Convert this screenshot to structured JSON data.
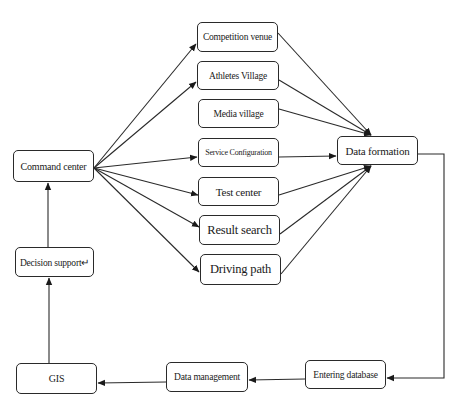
{
  "diagram": {
    "nodes": {
      "command_center": "Command center",
      "competition_venue": "Competition venue",
      "athletes_village": "Athletes Village",
      "media_village": "Media village",
      "service_configuration": "Service Configuration",
      "test_center": "Test center",
      "result_search": "Result search",
      "driving_path": "Driving path",
      "data_formation": "Data formation",
      "entering_database": "Entering database",
      "data_management": "Data management",
      "gis": "GIS",
      "decision_support": "Decision support↵"
    },
    "edges": [
      {
        "from": "command_center",
        "to": "competition_venue"
      },
      {
        "from": "command_center",
        "to": "athletes_village"
      },
      {
        "from": "command_center",
        "to": "service_configuration"
      },
      {
        "from": "command_center",
        "to": "test_center"
      },
      {
        "from": "command_center",
        "to": "result_search"
      },
      {
        "from": "command_center",
        "to": "driving_path"
      },
      {
        "from": "competition_venue",
        "to": "data_formation"
      },
      {
        "from": "athletes_village",
        "to": "data_formation"
      },
      {
        "from": "media_village",
        "to": "data_formation"
      },
      {
        "from": "service_configuration",
        "to": "data_formation"
      },
      {
        "from": "test_center",
        "to": "data_formation"
      },
      {
        "from": "result_search",
        "to": "data_formation"
      },
      {
        "from": "driving_path",
        "to": "data_formation"
      },
      {
        "from": "data_formation",
        "to": "entering_database"
      },
      {
        "from": "entering_database",
        "to": "data_management"
      },
      {
        "from": "data_management",
        "to": "gis"
      },
      {
        "from": "gis",
        "to": "decision_support"
      },
      {
        "from": "decision_support",
        "to": "command_center"
      }
    ]
  }
}
